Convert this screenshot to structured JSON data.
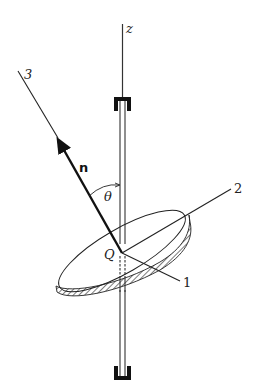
{
  "diagram": {
    "labels": {
      "axis_z": "z",
      "line_3": "3",
      "normal_vector": "n",
      "angle": "θ",
      "point": "Q",
      "line_2": "2",
      "line_1": "1"
    },
    "colors": {
      "ink": "#222222",
      "background": "#ffffff"
    }
  }
}
